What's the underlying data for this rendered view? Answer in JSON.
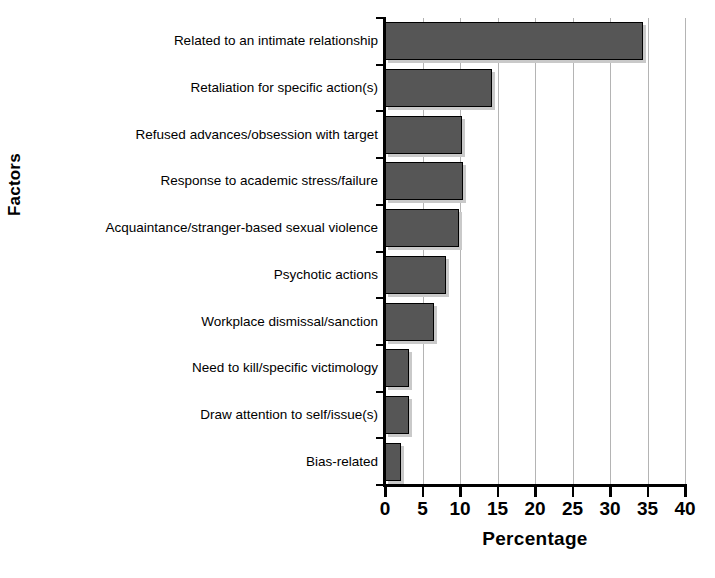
{
  "chart_data": {
    "type": "bar",
    "orientation": "horizontal",
    "title": "",
    "xlabel": "Percentage",
    "ylabel": "Factors",
    "xlim": [
      0,
      40
    ],
    "xticks": [
      0,
      5,
      10,
      15,
      20,
      25,
      30,
      35,
      40
    ],
    "grid": "vertical",
    "legend": "none",
    "categories": [
      "Related to an intimate relationship",
      "Retaliation for specific action(s)",
      "Refused advances/obsession with target",
      "Response to academic stress/failure",
      "Acquaintance/stranger-based sexual violence",
      "Psychotic actions",
      "Workplace dismissal/sanction",
      "Need to kill/specific victimology",
      "Draw attention to self/issue(s)",
      "Bias-related"
    ],
    "values": [
      34.4,
      14.3,
      10.3,
      10.4,
      9.9,
      8.1,
      6.5,
      3.2,
      3.2,
      2.1
    ],
    "colors": {
      "bar_fill": "#565656",
      "bar_border": "#000000",
      "bar_shadow": "#c9c9c9",
      "gridline": "#b4b4b4",
      "axis": "#000000",
      "text": "#000000",
      "background": "#ffffff"
    }
  }
}
